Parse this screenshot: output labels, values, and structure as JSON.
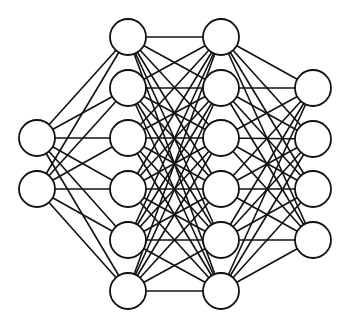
{
  "diagram": {
    "type": "fully-connected-neural-network",
    "width": 351,
    "height": 324,
    "node_radius": 18,
    "colors": {
      "stroke": "#111111",
      "fill": "#ffffff",
      "background": "#ffffff"
    },
    "layers": [
      {
        "name": "input-layer",
        "x": 37,
        "nodes_y": [
          138,
          189
        ]
      },
      {
        "name": "hidden-layer-1",
        "x": 128,
        "nodes_y": [
          37,
          88,
          138,
          189,
          240,
          291
        ]
      },
      {
        "name": "hidden-layer-2",
        "x": 221,
        "nodes_y": [
          37,
          88,
          138,
          189,
          240,
          291
        ]
      },
      {
        "name": "output-layer",
        "x": 313,
        "nodes_y": [
          88,
          139,
          189,
          240
        ]
      }
    ],
    "layer_sizes": [
      2,
      6,
      6,
      4
    ],
    "connectivity": "fully-connected between adjacent layers"
  }
}
